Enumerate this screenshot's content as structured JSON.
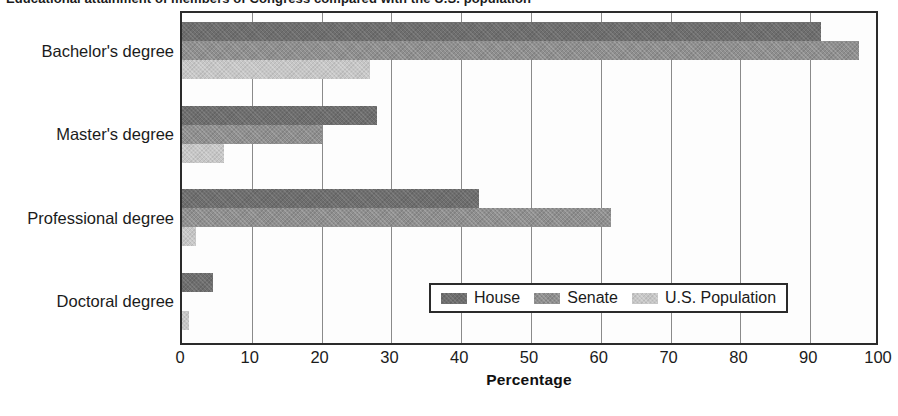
{
  "title_partial": "Educational attainment of members of Congress compared with the U.S. population",
  "chart_data": {
    "type": "bar",
    "orientation": "horizontal",
    "title": "",
    "xlabel": "Percentage",
    "ylabel": "",
    "xlim": [
      0,
      100
    ],
    "xticks": [
      "0",
      "10",
      "20",
      "30",
      "40",
      "50",
      "60",
      "70",
      "80",
      "90",
      "100"
    ],
    "grid": true,
    "legend_position": "inside-bottom-right",
    "categories": [
      "Bachelor's degree",
      "Master's degree",
      "Professional degree",
      "Doctoral degree"
    ],
    "series": [
      {
        "name": "House",
        "color": "#6e6e6e",
        "values": [
          91.5,
          28.0,
          42.5,
          4.5
        ]
      },
      {
        "name": "Senate",
        "color": "#8f8f8f",
        "values": [
          97.0,
          20.0,
          61.5,
          0.0
        ]
      },
      {
        "name": "U.S. Population",
        "color": "#c6c6c6",
        "values": [
          27.0,
          6.0,
          2.0,
          1.0
        ]
      }
    ]
  },
  "axis": {
    "x_title": "Percentage"
  },
  "legend": {
    "entries": [
      {
        "label": "House"
      },
      {
        "label": "Senate"
      },
      {
        "label": "U.S. Population"
      }
    ]
  },
  "colors": {
    "house": "#6e6e6e",
    "senate": "#8f8f8f",
    "us_population": "#c6c6c6",
    "axis": "#2b2b2b",
    "gridline": "#8a8a8a",
    "text": "#1b1b1b",
    "plot_background": "#fdfdfd"
  }
}
